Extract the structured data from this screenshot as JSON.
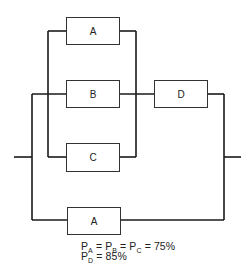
{
  "diagram": {
    "type": "reliability-block-diagram",
    "blocks": [
      {
        "id": "A_top",
        "label": "A"
      },
      {
        "id": "B",
        "label": "B"
      },
      {
        "id": "C",
        "label": "C"
      },
      {
        "id": "D",
        "label": "D"
      },
      {
        "id": "A_bottom",
        "label": "A"
      }
    ],
    "structure": "((A || B || C) -> D) || A",
    "formula": {
      "line1": [
        {
          "base": "P",
          "sub": "A"
        },
        {
          "op": " = "
        },
        {
          "base": "P",
          "sub": "B"
        },
        {
          "op": " = "
        },
        {
          "base": "P",
          "sub": "C"
        },
        {
          "op": " = 75%"
        }
      ],
      "line2": [
        {
          "base": "P",
          "sub": "D"
        },
        {
          "op": " = 85%"
        }
      ]
    }
  },
  "colors": {
    "line": "#1a1a1a",
    "background": "#ffffff"
  }
}
